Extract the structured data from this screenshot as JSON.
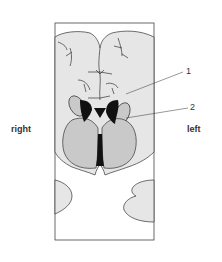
{
  "diagram": {
    "type": "anatomical coronal brain section",
    "side_labels": {
      "right": "right",
      "left": "left"
    },
    "callouts": [
      {
        "number": "1"
      },
      {
        "number": "2"
      }
    ],
    "colors": {
      "tissue_fill": "#e6e6e6",
      "nucleus_fill": "#c9c9c9",
      "ventricle_fill": "#111111",
      "outline": "#333333",
      "frame": "#444444",
      "background": "#ffffff"
    }
  }
}
